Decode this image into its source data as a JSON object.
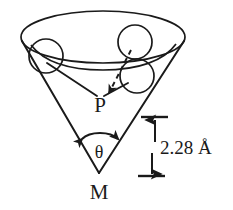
{
  "figure": {
    "type": "scientific-diagram",
    "background_color": "#ffffff",
    "stroke_color": "#1a1a1a",
    "labels": {
      "apex": "M",
      "point": "P",
      "angle": "θ",
      "distance": "2.28 Å"
    },
    "geometry": {
      "apex_point": {
        "x": 99,
        "y": 173
      },
      "point_p": {
        "x": 100,
        "y": 104
      },
      "rim_ellipse": {
        "cx": 103,
        "cy": 37,
        "rx": 82,
        "ry": 26
      },
      "inner_arc": {
        "cx": 103,
        "cy": 46,
        "rx": 68,
        "ry": 22
      },
      "cone_left_edge": {
        "x1": 22,
        "y1": 43,
        "x2": 99,
        "y2": 173
      },
      "cone_right_edge": {
        "x1": 184,
        "y1": 43,
        "x2": 99,
        "y2": 173
      },
      "circles": [
        {
          "name": "atom-left",
          "cx": 46,
          "cy": 56,
          "r": 17
        },
        {
          "name": "atom-upper-right",
          "cx": 135,
          "cy": 42,
          "r": 17
        },
        {
          "name": "atom-lower-right",
          "cx": 137,
          "cy": 76,
          "r": 17
        }
      ],
      "dimension": {
        "top_tick_y": 117,
        "bottom_tick_y": 176,
        "tick_x_start": 141,
        "tick_x_end": 168,
        "arrow_x": 155
      }
    }
  }
}
